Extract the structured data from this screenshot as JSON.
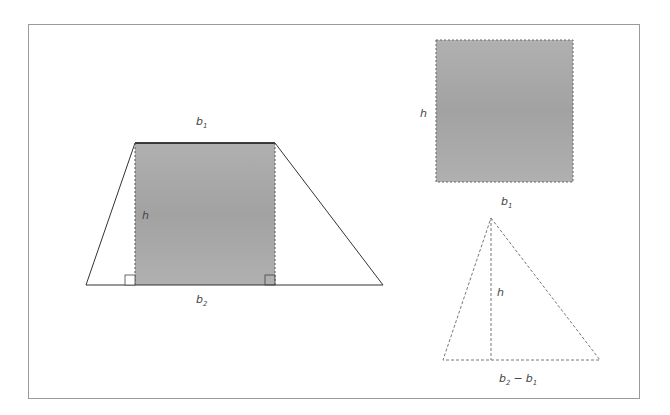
{
  "diagram": {
    "colors": {
      "frame": "#9a9a9a",
      "shade": "#a9a9a9",
      "stroke": "#333333",
      "dashed": "#777777",
      "label": "#444444"
    },
    "trapezoid": {
      "top_label": {
        "base": "b",
        "sub": "1"
      },
      "height_label": "h",
      "bottom_label": {
        "base": "b",
        "sub": "2"
      },
      "vertices": [
        [
          135,
          143
        ],
        [
          275,
          143
        ],
        [
          383,
          285
        ],
        [
          86,
          285
        ]
      ],
      "shaded_rect": {
        "x": 135,
        "y": 143,
        "w": 140,
        "h": 142
      }
    },
    "rectangle": {
      "height_label": "h",
      "width_label": {
        "base": "b",
        "sub": "1"
      },
      "rect": {
        "x": 436,
        "y": 40,
        "w": 137,
        "h": 142
      }
    },
    "triangle": {
      "height_label": "h",
      "base_label": {
        "b2": "b",
        "b2_sub": "2",
        "minus": "−",
        "b1": "b",
        "b1_sub": "1"
      },
      "vertices": [
        [
          491,
          218
        ],
        [
          600,
          360
        ],
        [
          443,
          360
        ]
      ]
    }
  }
}
